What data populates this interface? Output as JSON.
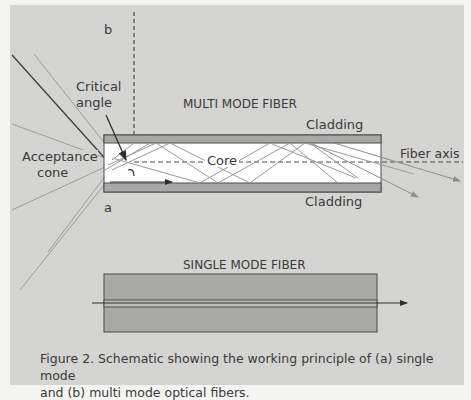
{
  "figure": {
    "labels": {
      "b": "b",
      "a": "a",
      "critical_angle_line1": "Critical",
      "critical_angle_line2": "angle",
      "multi_mode_title": "MULTI MODE FIBER",
      "cladding_top": "Cladding",
      "cladding_bottom": "Cladding",
      "core": "Core",
      "fiber_axis": "Fiber axis",
      "acceptance_line1": "Acceptance",
      "acceptance_line2": "cone",
      "single_mode_title": "SINGLE MODE FIBER"
    },
    "colors": {
      "panel_background": "#d4d4d2",
      "cladding": "#a9a9a7",
      "core": "#ffffff",
      "outline": "#4a4a4a",
      "ray": "#8e8e8e",
      "text": "#3a3a3a"
    }
  },
  "caption": {
    "line1": "Figure 2. Schematic showing the working principle of (a) single mode",
    "line2": "and (b) multi mode optical fibers."
  }
}
